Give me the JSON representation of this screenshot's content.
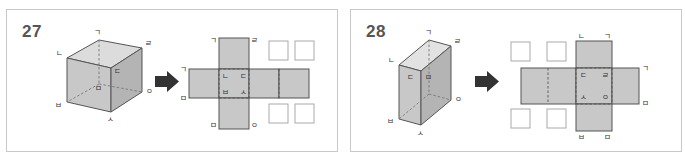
{
  "worksheet": {
    "background_color": "#ffffff",
    "panel_border_color": "#c9c9c9",
    "face_fill_color": "#c8c8c8",
    "face_fill_light": "#dcdcdc",
    "face_fill_dark": "#b4b4b4",
    "edge_color": "#555555",
    "arrow_color": "#333333",
    "number_color": "#555555"
  },
  "panels": [
    {
      "id": "panel-27",
      "number": "27",
      "solid": {
        "type": "cube",
        "vertex_labels": {
          "top_back": "ㄱ",
          "top_right_back": "ㄹ",
          "top_left_front": "ㄴ",
          "top_right_front": "ㄷ",
          "right_front": "ㅇ",
          "bottom_left": "ㅂ",
          "bottom_center": "ㅁ",
          "bottom_front": "ㅅ"
        },
        "labels_list": [
          "ㄱ",
          "ㄹ",
          "ㄴ",
          "ㄷ",
          "ㅇ",
          "ㅂ",
          "ㅁ",
          "ㅅ"
        ]
      },
      "arrow": {
        "glyph": "right-arrow",
        "direction": "right"
      },
      "net": {
        "type": "cross-net",
        "shaded_cells": [
          "top",
          "left",
          "center",
          "right",
          "far-right",
          "bottom"
        ],
        "empty_cells": [
          "top-right-1",
          "top-right-2",
          "bottom-right-1",
          "bottom-right-2"
        ],
        "labels": [
          {
            "text": "ㄱ",
            "position": "top-cell-top-left"
          },
          {
            "text": "ㄹ",
            "position": "top-cell-top-right"
          },
          {
            "text": "ㄱ",
            "position": "left-cell-outer-top"
          },
          {
            "text": "ㄴ",
            "position": "center-cell-top-left"
          },
          {
            "text": "ㄷ",
            "position": "center-cell-top-right"
          },
          {
            "text": "ㅂ",
            "position": "center-cell-bottom-left"
          },
          {
            "text": "ㅅ",
            "position": "center-cell-bottom-right"
          },
          {
            "text": "ㅁ",
            "position": "left-cell-outer-bottom"
          },
          {
            "text": "ㅁ",
            "position": "bottom-cell-bottom-left"
          },
          {
            "text": "ㅇ",
            "position": "bottom-cell-bottom-right"
          }
        ]
      }
    },
    {
      "id": "panel-28",
      "number": "28",
      "solid": {
        "type": "rectangular-prism",
        "vertex_labels": {
          "top_back": "ㄱ",
          "top_right_back": "ㄹ",
          "top_left_front": "ㄴ",
          "mid_left_front": "ㄷ",
          "mid_center": "ㅁ",
          "right_front": "ㅇ",
          "bottom_left": "ㅂ",
          "bottom_front": "ㅅ"
        },
        "labels_list": [
          "ㄱ",
          "ㄹ",
          "ㄴ",
          "ㄷ",
          "ㅁ",
          "ㅇ",
          "ㅂ",
          "ㅅ"
        ]
      },
      "arrow": {
        "glyph": "right-arrow",
        "direction": "right"
      },
      "net": {
        "type": "cross-net",
        "shaded_cells": [
          "top",
          "left-wide",
          "center",
          "right",
          "bottom"
        ],
        "empty_cells": [
          "top-left-1",
          "top-left-2",
          "bottom-left-1",
          "bottom-left-2"
        ],
        "labels": [
          {
            "text": "ㄴ",
            "position": "top-cell-top-left"
          },
          {
            "text": "ㄱ",
            "position": "top-cell-top-right"
          },
          {
            "text": "ㄷ",
            "position": "center-cell-top-left"
          },
          {
            "text": "ㄹ",
            "position": "center-cell-top-right"
          },
          {
            "text": "ㄱ",
            "position": "right-cell-outer-top"
          },
          {
            "text": "ㅅ",
            "position": "center-cell-bottom-left"
          },
          {
            "text": "ㅇ",
            "position": "center-cell-bottom-right"
          },
          {
            "text": "ㅁ",
            "position": "right-cell-outer-bottom"
          },
          {
            "text": "ㅂ",
            "position": "bottom-cell-bottom-left"
          },
          {
            "text": "ㅁ",
            "position": "bottom-cell-bottom-right"
          }
        ]
      }
    }
  ]
}
